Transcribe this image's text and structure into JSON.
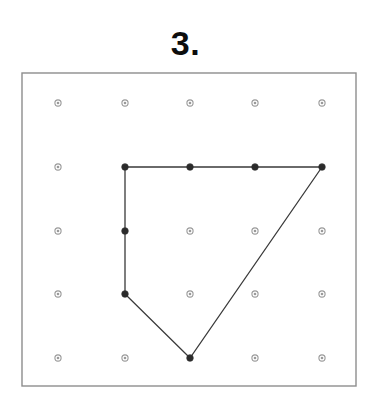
{
  "page": {
    "title": "3.",
    "background_color": "#ffffff",
    "width": 371,
    "height": 407
  },
  "frame": {
    "name": "geoboard-frame",
    "x": 22,
    "y": 73,
    "width": 334,
    "height": 313,
    "stroke_color": "#8d8d8d",
    "stroke_width": 1.4,
    "fill": "none"
  },
  "geoboard": {
    "rows": 5,
    "cols": 5,
    "col_x": [
      58,
      125,
      190,
      255,
      322
    ],
    "row_y": [
      103,
      167,
      231,
      294,
      358
    ],
    "peg_radius": 3.1,
    "peg_inner_radius": 1.3,
    "peg_stroke_color": "#9a9a9a",
    "peg_fill_color": "#ffffff",
    "peg_highlight_color": "#2b2b2b",
    "highlighted_pegs": [
      {
        "col": 1,
        "row": 1,
        "label": "top-left-vertex"
      },
      {
        "col": 2,
        "row": 1,
        "label": "top-edge-peg"
      },
      {
        "col": 3,
        "row": 1,
        "label": "top-edge-peg"
      },
      {
        "col": 4,
        "row": 1,
        "label": "top-right-vertex"
      },
      {
        "col": 1,
        "row": 2,
        "label": "left-edge-peg"
      },
      {
        "col": 1,
        "row": 3,
        "label": "lower-left-vertex"
      },
      {
        "col": 2,
        "row": 4,
        "label": "bottom-vertex"
      }
    ]
  },
  "shape": {
    "name": "quadrilateral",
    "stroke_color": "#3a3a3a",
    "stroke_width": 1.3,
    "fill": "none",
    "vertices": [
      {
        "col": 1,
        "row": 1,
        "x": 125,
        "y": 167
      },
      {
        "col": 4,
        "row": 1,
        "x": 322,
        "y": 167
      },
      {
        "col": 2,
        "row": 4,
        "x": 190,
        "y": 358
      },
      {
        "col": 1,
        "row": 3,
        "x": 125,
        "y": 294
      }
    ],
    "closed": true
  }
}
